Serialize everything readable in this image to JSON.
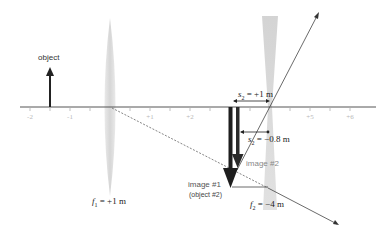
{
  "diagram": {
    "axis": {
      "tick_labels": [
        "-2",
        "-1",
        "+1",
        "+2",
        "+5",
        "+6"
      ],
      "tick_values": [
        -2,
        -1,
        1,
        2,
        5,
        6
      ],
      "units": "m",
      "range": [
        -2.2,
        6.6
      ]
    },
    "object": {
      "label": "object",
      "position_m": -1.5
    },
    "lens1": {
      "label_f": "f",
      "label_sub": "1",
      "label_eq": " = +1 m",
      "position_m": 0,
      "type": "converging"
    },
    "lens2": {
      "label_f": "f",
      "label_sub": "2",
      "label_eq": " = −4 m",
      "position_m": 4,
      "type": "diverging"
    },
    "image1": {
      "label": "image #1",
      "sublabel": "(object #2)",
      "position_m": 3
    },
    "image2": {
      "label": "image #2",
      "position_m": 3.2
    },
    "s2": {
      "label_s": "s",
      "label_sub": "2",
      "label_eq": " = +1 m"
    },
    "s2prime": {
      "label_s": "s",
      "label_sub": "2",
      "label_prime": "′",
      "label_eq": " = −0.8 m"
    },
    "colors": {
      "axis": "#555555",
      "arrow": "#222222",
      "lens": "#d4d4d4",
      "tick_label": "#b8b8b8",
      "image2_label": "#888888",
      "ray": "#444444"
    }
  }
}
